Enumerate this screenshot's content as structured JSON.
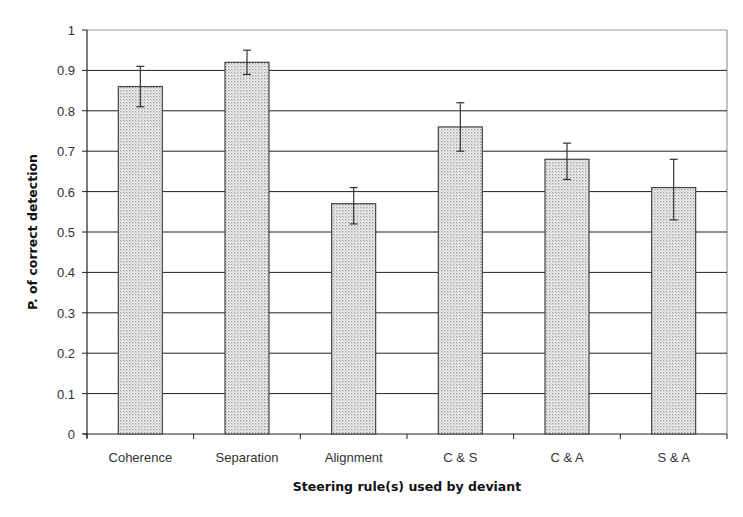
{
  "chart_data": {
    "type": "bar",
    "title": "",
    "xlabel": "Steering rule(s) used by deviant",
    "ylabel": "P. of correct detection",
    "categories": [
      "Coherence",
      "Separation",
      "Alignment",
      "C & S",
      "C & A",
      "S & A"
    ],
    "values": [
      0.86,
      0.92,
      0.57,
      0.76,
      0.68,
      0.61
    ],
    "error_bars": {
      "upper": [
        0.91,
        0.95,
        0.61,
        0.82,
        0.72,
        0.68
      ],
      "lower": [
        0.81,
        0.89,
        0.52,
        0.7,
        0.63,
        0.53
      ]
    },
    "ylim": [
      0,
      1
    ],
    "yticks": [
      "0",
      "0.1",
      "0.2",
      "0.3",
      "0.4",
      "0.5",
      "0.6",
      "0.7",
      "0.8",
      "0.9",
      "1"
    ],
    "grid": "horizontal",
    "legend": "none",
    "bar_fill": "dotted light gray",
    "colors": {
      "bar_border": "#444444",
      "bar_dot": "#9a9a9a",
      "gridline": "#222222",
      "frame": "#9a9a9a",
      "axis": "#222222"
    }
  }
}
